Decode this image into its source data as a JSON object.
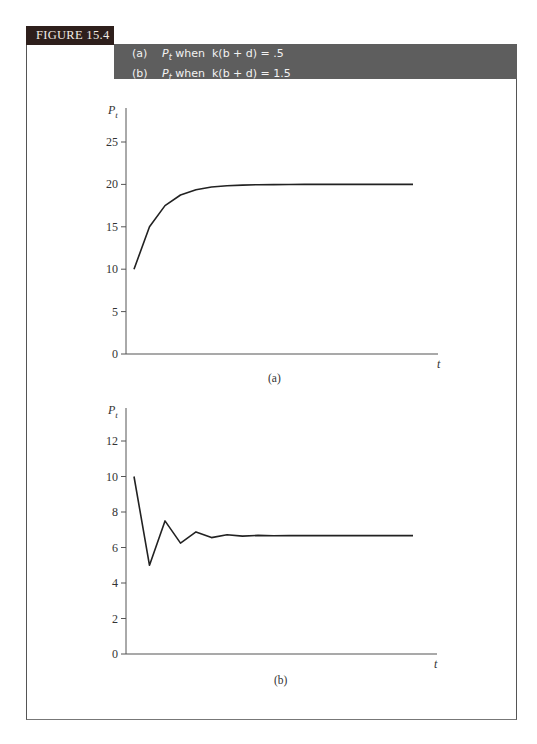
{
  "figure": {
    "tag": "FIGURE 15.4",
    "caption": [
      {
        "label": "(a)",
        "var": "P",
        "sub": "t",
        "text": " when  k(b + d) = .5"
      },
      {
        "label": "(b)",
        "var": "P",
        "sub": "t",
        "text": " when  k(b + d) = 1.5"
      }
    ]
  },
  "chart_data": [
    {
      "type": "line",
      "title": "(a)",
      "subtitle": "P_t when k(b + d) = .5",
      "xlabel": "t",
      "ylabel": "P_t",
      "ylim": [
        0,
        27
      ],
      "yticks": [
        0,
        5,
        10,
        15,
        20,
        25
      ],
      "grid": false,
      "legend": null,
      "x": [
        0,
        1,
        2,
        3,
        4,
        5,
        6,
        7,
        8,
        9,
        10,
        11,
        12,
        13,
        14,
        15,
        16,
        17,
        18
      ],
      "series": [
        {
          "name": "P_t",
          "values": [
            10,
            15,
            17.5,
            18.75,
            19.38,
            19.69,
            19.84,
            19.92,
            19.96,
            19.98,
            19.99,
            20,
            20,
            20,
            20,
            20,
            20,
            20,
            20
          ]
        }
      ]
    },
    {
      "type": "line",
      "title": "(b)",
      "subtitle": "P_t when k(b + d) = 1.5",
      "xlabel": "t",
      "ylabel": "P_t",
      "ylim": [
        0,
        13
      ],
      "yticks": [
        0,
        2,
        4,
        6,
        8,
        10,
        12
      ],
      "grid": false,
      "legend": null,
      "x": [
        0,
        1,
        2,
        3,
        4,
        5,
        6,
        7,
        8,
        9,
        10,
        11,
        12,
        13,
        14,
        15,
        16,
        17,
        18
      ],
      "series": [
        {
          "name": "P_t",
          "values": [
            10,
            5,
            7.5,
            6.25,
            6.88,
            6.56,
            6.72,
            6.64,
            6.68,
            6.66,
            6.67,
            6.67,
            6.67,
            6.67,
            6.67,
            6.67,
            6.67,
            6.67,
            6.67
          ]
        }
      ]
    }
  ],
  "colors": {
    "tag_bg": "#2e1f1c",
    "caption_bg": "#5e5e5e",
    "line": "#222222",
    "axis": "#555555"
  }
}
